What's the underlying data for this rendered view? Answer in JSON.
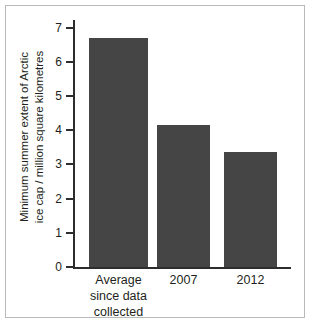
{
  "chart_data": {
    "type": "bar",
    "title": "",
    "subtitle": "",
    "xlabel": "",
    "ylabel": "Minimum summer extent of Arctic ice cap / million square kilometres",
    "ylabel_lines": [
      "Minimum summer extent of Arctic",
      "ice cap / million square kilometres"
    ],
    "categories": [
      "Average since data collected",
      "2007",
      "2012"
    ],
    "category_lines": [
      [
        "Average",
        "since data",
        "collected"
      ],
      [
        "2007"
      ],
      [
        "2012"
      ]
    ],
    "values": [
      6.7,
      4.15,
      3.35
    ],
    "ylim": [
      0,
      7
    ],
    "yticks": [
      0,
      1,
      2,
      3,
      4,
      5,
      6,
      7
    ],
    "ytick_labels": [
      "0",
      "1",
      "2",
      "3",
      "4",
      "5",
      "6",
      "7"
    ],
    "grid": false,
    "legend": false,
    "legend_position": "none",
    "bar_color": "#454545",
    "axis_color": "#2d2d2d",
    "text_color": "#231f20",
    "background_color": "#ffffff",
    "frame_color": "#b9b9bd"
  }
}
